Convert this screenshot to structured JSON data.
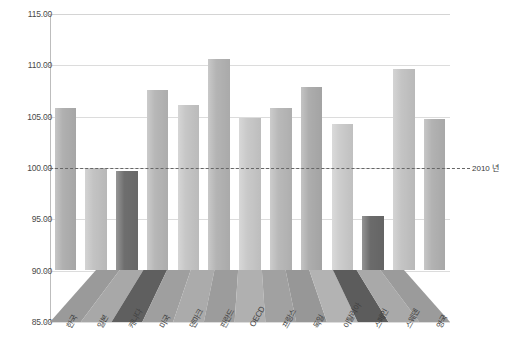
{
  "chart_data": {
    "type": "bar",
    "title": "",
    "subtitle": "",
    "xlabel": "",
    "ylabel": "",
    "ylim": [
      85.0,
      115.0
    ],
    "ytick_step": 5.0,
    "ytick_labels": [
      "115.00",
      "110.00",
      "105.00",
      "100.00",
      "95.00",
      "90.00",
      "85.00"
    ],
    "ytick_values": [
      115.0,
      110.0,
      105.0,
      100.0,
      95.0,
      90.0,
      85.0
    ],
    "grid": true,
    "legend": "none",
    "three_d_floor": true,
    "reference_line": {
      "value": 100.0,
      "label": "2010 년",
      "style": "dashed"
    },
    "categories": [
      "한국",
      "일본",
      "캐나다",
      "미국",
      "덴마크",
      "핀란드",
      "OECD",
      "프랑스",
      "독일",
      "이탈리아",
      "스페인",
      "스웨덴",
      "영국"
    ],
    "values": [
      105.8,
      100.0,
      99.7,
      107.6,
      106.1,
      110.6,
      104.9,
      105.8,
      107.9,
      104.3,
      95.3,
      109.6,
      104.8
    ],
    "bar_colors": [
      "#b0b0b0",
      "#c3c3c3",
      "#6e6e6e",
      "#b7b7b7",
      "#c6c6c6",
      "#b4b4b4",
      "#c9c9c9",
      "#b9b9b9",
      "#adadad",
      "#cccccc",
      "#6b6b6b",
      "#c4c4c4",
      "#b2b2b2"
    ],
    "floor_colors": [
      "#9a9a9a",
      "#a8a8a8",
      "#5f5f5f",
      "#9f9f9f",
      "#ababab",
      "#9c9c9c",
      "#b0b0b0",
      "#a1a1a1",
      "#979797",
      "#b3b3b3",
      "#5c5c5c",
      "#a9a9a9",
      "#9b9b9b"
    ]
  },
  "colors": {
    "background": "#ffffff",
    "gridline": "#dcdcdc",
    "axis": "#bdbdbd",
    "tick_text": "#4a4a4a",
    "category_text": "#3f3f3f",
    "reference_line": "#666666"
  }
}
